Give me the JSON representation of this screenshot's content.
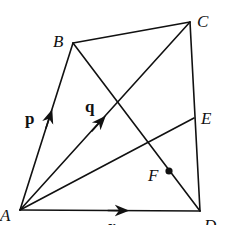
{
  "diagram": {
    "type": "quadrilateral-vectors",
    "points": {
      "A": {
        "label": "A",
        "x": 20,
        "y": 210
      },
      "B": {
        "label": "B",
        "x": 73,
        "y": 43
      },
      "C": {
        "label": "C",
        "x": 190,
        "y": 22
      },
      "D": {
        "label": "D",
        "x": 200,
        "y": 211
      },
      "E": {
        "label": "E",
        "x": 194,
        "y": 118
      },
      "F": {
        "label": "F",
        "x": 169,
        "y": 171
      }
    },
    "segments": [
      [
        "A",
        "B"
      ],
      [
        "B",
        "C"
      ],
      [
        "C",
        "D"
      ],
      [
        "A",
        "D"
      ],
      [
        "A",
        "C"
      ],
      [
        "B",
        "D"
      ],
      [
        "A",
        "E"
      ]
    ],
    "vectors": [
      {
        "from": "A",
        "to": "B",
        "label": "p"
      },
      {
        "from": "A",
        "to": "C",
        "label": "q"
      },
      {
        "from": "A",
        "to": "D",
        "label": "r"
      }
    ],
    "marked_point": "F",
    "stroke_color": "#111111"
  }
}
